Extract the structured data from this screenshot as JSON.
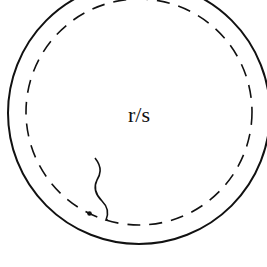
{
  "diagram": {
    "center_label": "r/s",
    "colors": {
      "stroke": "#111111",
      "background": "#ffffff"
    },
    "shapes": {
      "outer_circle": {
        "style": "solid"
      },
      "inner_circle": {
        "style": "dashed"
      },
      "wavy_line": {
        "style": "solid"
      },
      "point": {
        "style": "filled-dot"
      }
    }
  }
}
